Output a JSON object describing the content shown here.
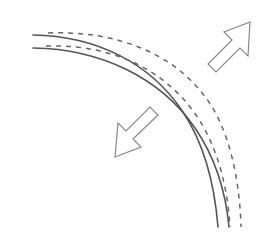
{
  "figure": {
    "width": 267,
    "height": 240,
    "background_color": "#ffffff",
    "colors": {
      "solid_curve_stroke": "#555555",
      "dashed_curve_stroke": "#666666",
      "arrow_stroke": "#888888",
      "arrow_fill": "#ffffff"
    },
    "stroke_widths": {
      "solid_curve": 1.6,
      "dashed_curve": 1.5,
      "arrow": 1.2
    },
    "dash_pattern": "5 5"
  },
  "curves": [
    {
      "id": "solid-curve-inner",
      "style": "solid",
      "path": "M 33 35 C 95 36, 150 62, 183 112 C 207 148, 215 190, 218 227"
    },
    {
      "id": "solid-curve-outer",
      "style": "solid",
      "path": "M 33 48 C 100 49, 160 77, 195 128 C 217 160, 226 195, 229 227"
    },
    {
      "id": "dashed-curve-inner",
      "style": "dashed",
      "path": "M 46 46 C 110 44, 165 68, 198 118 C 220 152, 228 193, 230 227"
    },
    {
      "id": "dashed-curve-outer",
      "style": "dashed",
      "path": "M 48 33 C 120 30, 182 56, 214 110 C 234 146, 240 192, 241 227"
    }
  ],
  "arrows": [
    {
      "id": "arrow-northeast",
      "direction": "up-right",
      "points": "250,22 224,32 232,40 208,64 216,72 240,48 248,56",
      "label": "outward shift arrow"
    },
    {
      "id": "arrow-southwest",
      "direction": "down-left",
      "points": "115,157 141,147 133,139 158,115 150,107 126,131 118,123",
      "label": "inward shift arrow"
    }
  ]
}
